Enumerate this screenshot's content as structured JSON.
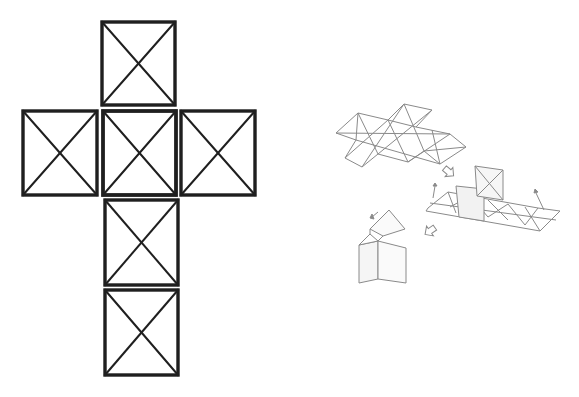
{
  "diagram": {
    "colors": {
      "background": "#ffffff",
      "net_stroke": "#1f1f1f",
      "sketch_stroke": "#8a8a8a",
      "sketch_fill": "#f2f2f2"
    },
    "cube_net": {
      "description": "Cross-shaped net of six squares, each with both diagonals drawn",
      "faces": [
        {
          "id": "top",
          "x": 102,
          "y": 22,
          "w": 73,
          "h": 83
        },
        {
          "id": "left",
          "x": 23,
          "y": 111,
          "w": 74,
          "h": 84
        },
        {
          "id": "center",
          "x": 103,
          "y": 111,
          "w": 73,
          "h": 84
        },
        {
          "id": "right",
          "x": 181,
          "y": 111,
          "w": 74,
          "h": 84
        },
        {
          "id": "lower",
          "x": 105,
          "y": 200,
          "w": 73,
          "h": 85
        },
        {
          "id": "bottom",
          "x": 105,
          "y": 290,
          "w": 73,
          "h": 85
        }
      ]
    },
    "sketch": {
      "description": "Isometric sketches showing a triangulated flat net, a partially folded net, and the assembled house shape, connected by arrows",
      "steps": [
        {
          "id": "flat-net",
          "label": "Flat triangulated net"
        },
        {
          "id": "folding-net",
          "label": "Net with faces folded up"
        },
        {
          "id": "house",
          "label": "Assembled house shape"
        }
      ]
    }
  }
}
